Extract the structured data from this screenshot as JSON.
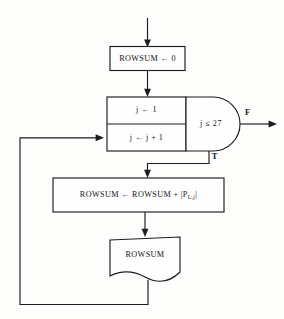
{
  "diagram": {
    "type": "flowchart",
    "title_visible": false,
    "background_color": "#fdfdfc",
    "line_color": "#1d1d1d",
    "nodes": {
      "init": {
        "shape": "process",
        "label": "ROWSUM ← 0"
      },
      "loop_init_cell": {
        "shape": "process",
        "label": "j ← 1"
      },
      "loop_increment_cell": {
        "shape": "process",
        "label": "j ← j + 1"
      },
      "condition": {
        "shape": "decision-d",
        "label": "j ≤ 27"
      },
      "accumulate": {
        "shape": "process",
        "label_prefix": "ROWSUM ← ROWSUM + |P",
        "label_subscript": "L,j",
        "label_suffix": "|"
      },
      "output": {
        "shape": "document",
        "label": "ROWSUM"
      }
    },
    "branch_labels": {
      "false": "F",
      "true": "T"
    },
    "edges": [
      {
        "name": "entry-arrow",
        "from": "top-edge",
        "to": "init"
      },
      {
        "name": "init-to-loop",
        "from": "init",
        "to": "loop_init_cell"
      },
      {
        "name": "true-branch",
        "from": "condition",
        "to": "accumulate",
        "label": "T"
      },
      {
        "name": "false-branch",
        "from": "condition",
        "to": "exit-right",
        "label": "F"
      },
      {
        "name": "accumulate-to-output",
        "from": "accumulate",
        "to": "output"
      },
      {
        "name": "feedback-loop",
        "from": "output",
        "to": "loop_increment_cell"
      }
    ]
  }
}
